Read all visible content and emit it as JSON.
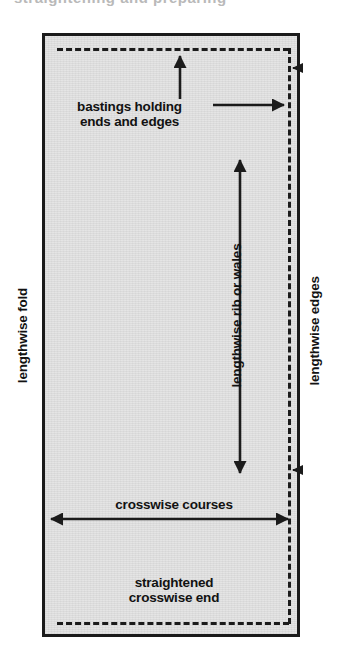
{
  "figure": {
    "type": "diagram",
    "top_cropped_text": "straightening and preparing",
    "fill_color": "#e3e3e3",
    "ink_color": "#1b1b1b",
    "background_color": "#ffffff"
  },
  "labels": {
    "bastings": "bastings holding\nends and edges",
    "lengthwise_fold": "lengthwise fold",
    "lengthwise_edges": "lengthwise edges",
    "lengthwise_rib": "lengthwise rib or wales",
    "crosswise_courses": "crosswise courses",
    "straightened_end": "straightened\ncrosswise end"
  },
  "elements": {
    "fabric_rect": "fabric-rectangle",
    "dashed_top": "top-basting-dashed-line",
    "dashed_bottom": "bottom-basting-dashed-line",
    "dashed_right": "right-edge-basting-dashed-line",
    "arrow_up_to_top_basting": "arrow-up-to-top-basting",
    "arrow_right_to_edge_basting": "arrow-right-to-edge-basting",
    "arrow_vertical_grain": "double-arrow-lengthwise-grain",
    "arrow_horizontal_grain": "double-arrow-crosswise-grain",
    "tick_upper_right": "arrowhead-upper-right",
    "tick_lower_right": "arrowhead-lower-right"
  }
}
